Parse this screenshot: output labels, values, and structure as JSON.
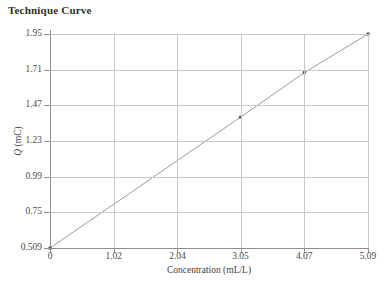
{
  "chart_data": {
    "type": "line",
    "title": "Technique Curve",
    "xlabel": "Concentration (mL/L)",
    "ylabel": "Q (mC)",
    "ylabel_symbol": "Q",
    "ylabel_units": " (mC)",
    "xlim": [
      0,
      5.09
    ],
    "ylim": [
      0.509,
      1.95
    ],
    "grid": true,
    "legend": "none",
    "xticks": [
      0,
      1.02,
      2.04,
      3.05,
      4.07,
      5.09
    ],
    "xticklabels": [
      "0",
      "1.02",
      "2.04",
      "3.05",
      "4.07",
      "5.09"
    ],
    "yticks": [
      0.509,
      0.75,
      0.99,
      1.23,
      1.47,
      1.71,
      1.95
    ],
    "yticklabels": [
      "0.509",
      "0.75",
      "0.99",
      "1.23",
      "1.47",
      "1.71",
      "1.95"
    ],
    "series": [
      {
        "name": "Technique Curve",
        "color": "#9a9a9a",
        "marker": "square",
        "x": [
          0,
          3.05,
          4.07,
          5.09
        ],
        "y": [
          0.509,
          1.39,
          1.69,
          1.95
        ]
      }
    ]
  },
  "style": {
    "grid_color": "#c8c8c8",
    "axis_color": "#8d8d8d",
    "text_color": "#3f3f3f",
    "line_color": "#9a9a9a",
    "background": "#ffffff"
  }
}
